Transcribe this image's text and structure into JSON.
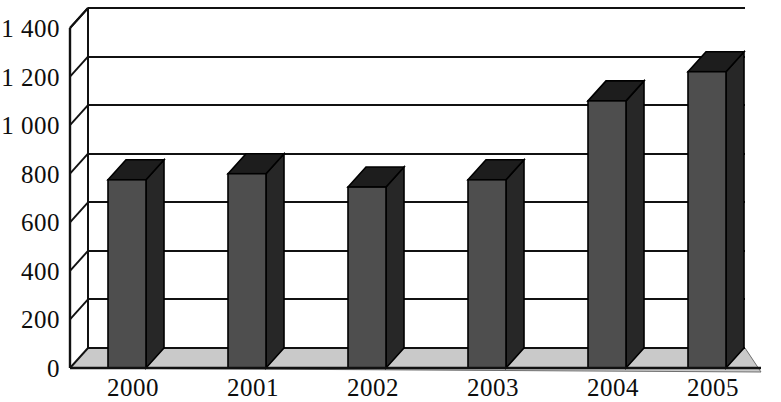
{
  "chart_data": {
    "type": "bar",
    "title": "",
    "subtitle": "",
    "xlabel": "",
    "ylabel": "",
    "categories": [
      "2000",
      "2001",
      "2002",
      "2003",
      "2004",
      "2005"
    ],
    "values": [
      775,
      800,
      745,
      775,
      1100,
      1220
    ],
    "series": [
      {
        "name": "",
        "values": [
          775,
          800,
          745,
          775,
          1100,
          1220
        ]
      }
    ],
    "ylim": [
      0,
      1400
    ],
    "ytick_labels": [
      "0",
      "200",
      "400",
      "600",
      "800",
      "1 000",
      "1 200",
      "1 400"
    ],
    "ytick_values": [
      0,
      200,
      400,
      600,
      800,
      1000,
      1200,
      1400
    ],
    "grid": true,
    "grid_axis": "y",
    "legend": false,
    "legend_position": "none",
    "style": "3d-column",
    "bar_color": "#4e4e4e",
    "bar_side_color": "#272727",
    "bar_top_color": "#1d1d1d",
    "floor_color": "#c9c9c9",
    "wall_color": "#ffffff",
    "line_color": "#111111",
    "text_color": "#0d0d0d",
    "annotations": []
  },
  "figure": {
    "background": "#ffffff",
    "width": 781,
    "height": 402
  }
}
